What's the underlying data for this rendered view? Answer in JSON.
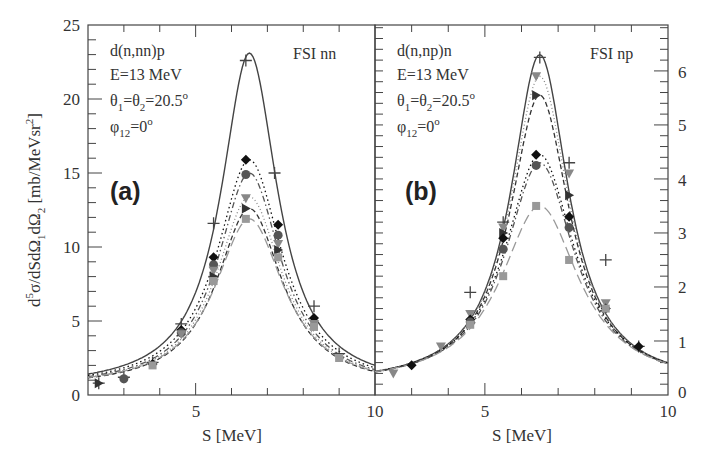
{
  "chart_data": [
    {
      "type": "line",
      "panel": "(a)",
      "title": "FSI nn",
      "annotations": [
        "d(n,nn)p",
        "E=13 MeV",
        "θ1=θ2=20.5°",
        "φ12=0°"
      ],
      "xlabel": "S [MeV]",
      "ylabel": "d5σ/dSdΩ1dΩ2 [mb/MeVsr2]",
      "xlim": [
        2,
        10
      ],
      "ylim": [
        0,
        25
      ],
      "x_ticks": [
        5,
        10
      ],
      "y_ticks": [
        0,
        5,
        10,
        15,
        20,
        25
      ],
      "peak_S": 6.5,
      "series": [
        {
          "name": "solid (+)",
          "style": "solid",
          "marker": "plus",
          "peak": 23.1,
          "width": 0.95,
          "tail": 0.9,
          "color": "#444444",
          "points": [
            [
              2.3,
              0.8
            ],
            [
              3.0,
              1.2
            ],
            [
              3.8,
              2.2
            ],
            [
              4.6,
              4.8
            ],
            [
              5.5,
              11.6
            ],
            [
              6.4,
              22.6
            ],
            [
              7.2,
              15.0
            ],
            [
              8.3,
              6.0
            ],
            [
              9.0,
              2.8
            ]
          ]
        },
        {
          "name": "dotted (◆)",
          "style": "dotted",
          "marker": "diamond",
          "peak": 15.9,
          "width": 1.1,
          "tail": 0.9,
          "color": "#111111",
          "points": [
            [
              3.8,
              2.1
            ],
            [
              4.6,
              4.4
            ],
            [
              5.5,
              9.3
            ],
            [
              6.4,
              15.9
            ],
            [
              7.3,
              11.5
            ],
            [
              8.3,
              5.2
            ]
          ]
        },
        {
          "name": "dash-dot (●)",
          "style": "dashdot",
          "marker": "circle",
          "peak": 15.0,
          "width": 1.08,
          "tail": 0.9,
          "color": "#555555",
          "points": [
            [
              3.0,
              1.1
            ],
            [
              4.6,
              4.2
            ],
            [
              5.5,
              8.8
            ],
            [
              6.4,
              14.9
            ],
            [
              7.3,
              10.8
            ]
          ]
        },
        {
          "name": "dotted (▼)",
          "style": "dotted2",
          "marker": "tri-down",
          "peak": 13.4,
          "width": 1.12,
          "tail": 0.9,
          "color": "#888888",
          "points": [
            [
              4.6,
              4.1
            ],
            [
              5.5,
              8.4
            ],
            [
              6.4,
              13.3
            ],
            [
              7.3,
              10.2
            ],
            [
              8.3,
              4.8
            ]
          ]
        },
        {
          "name": "dashed (▶)",
          "style": "dashed",
          "marker": "tri-right",
          "peak": 12.6,
          "width": 1.12,
          "tail": 0.9,
          "color": "#333333",
          "points": [
            [
              2.3,
              0.8
            ],
            [
              5.5,
              8.0
            ],
            [
              6.4,
              12.6
            ],
            [
              7.3,
              9.8
            ]
          ]
        },
        {
          "name": "long-dash (■)",
          "style": "longdash",
          "marker": "square",
          "peak": 11.9,
          "width": 1.18,
          "tail": 0.9,
          "color": "#999999",
          "points": [
            [
              3.8,
              2.0
            ],
            [
              5.5,
              7.7
            ],
            [
              6.4,
              11.9
            ],
            [
              7.3,
              9.3
            ],
            [
              8.3,
              4.6
            ],
            [
              9.0,
              2.5
            ]
          ]
        }
      ]
    },
    {
      "type": "line",
      "panel": "(b)",
      "title": "FSI np",
      "annotations": [
        "d(n,np)n",
        "E=13 MeV",
        "θ1=θ2=20.5°",
        "φ12=0°"
      ],
      "xlabel": "S [MeV]",
      "ylabel": "",
      "xlim": [
        2,
        10
      ],
      "ylim": [
        0,
        6.85
      ],
      "x_ticks": [
        5,
        10
      ],
      "y_ticks": [
        0,
        1,
        2,
        3,
        4,
        5,
        6
      ],
      "peak_S": 6.5,
      "series": [
        {
          "name": "solid (+)",
          "style": "solid",
          "marker": "plus",
          "peak": 6.3,
          "width": 0.95,
          "tail": 0.35,
          "color": "#444444",
          "points": [
            [
              4.6,
              1.9
            ],
            [
              5.5,
              3.2
            ],
            [
              6.5,
              6.25
            ],
            [
              7.3,
              4.3
            ],
            [
              8.3,
              2.5
            ],
            [
              9.2,
              0.9
            ]
          ]
        },
        {
          "name": "dotted (▼)",
          "style": "dotted2",
          "marker": "tri-down",
          "peak": 5.9,
          "width": 0.98,
          "tail": 0.35,
          "color": "#888888",
          "points": [
            [
              2.5,
              0.4
            ],
            [
              3.8,
              0.9
            ],
            [
              4.6,
              1.5
            ],
            [
              5.5,
              3.1
            ],
            [
              6.4,
              5.9
            ],
            [
              7.3,
              4.1
            ],
            [
              8.3,
              1.7
            ]
          ]
        },
        {
          "name": "dashed (▶)",
          "style": "dashed",
          "marker": "tri-right",
          "peak": 5.55,
          "width": 1.0,
          "tail": 0.35,
          "color": "#333333",
          "points": [
            [
              5.5,
              3.0
            ],
            [
              6.4,
              5.55
            ],
            [
              7.3,
              3.7
            ]
          ]
        },
        {
          "name": "dotted (◆)",
          "style": "dotted",
          "marker": "diamond",
          "peak": 4.45,
          "width": 1.15,
          "tail": 0.35,
          "color": "#111111",
          "points": [
            [
              3.0,
              0.55
            ],
            [
              4.6,
              1.4
            ],
            [
              5.5,
              2.9
            ],
            [
              6.4,
              4.45
            ],
            [
              7.3,
              3.3
            ],
            [
              8.3,
              1.6
            ],
            [
              9.2,
              0.9
            ]
          ]
        },
        {
          "name": "dash-dot (●)",
          "style": "dashdot",
          "marker": "circle",
          "peak": 4.3,
          "width": 1.15,
          "tail": 0.35,
          "color": "#555555",
          "points": [
            [
              4.6,
              1.35
            ],
            [
              5.5,
              2.7
            ],
            [
              6.4,
              4.25
            ],
            [
              7.3,
              3.1
            ]
          ]
        },
        {
          "name": "long-dash (■)",
          "style": "longdash",
          "marker": "square",
          "peak": 3.5,
          "width": 1.3,
          "tail": 0.35,
          "color": "#999999",
          "points": [
            [
              4.6,
              1.3
            ],
            [
              5.5,
              2.2
            ],
            [
              6.4,
              3.5
            ],
            [
              7.3,
              2.5
            ],
            [
              8.3,
              1.6
            ]
          ]
        }
      ]
    }
  ],
  "figure": {
    "panel_a": {
      "label": "(a)",
      "fsi": "FSI nn",
      "reaction": "d(n,nn)p",
      "energy": "E=13 MeV",
      "y_ticks": [
        "25",
        "20",
        "15",
        "10",
        "5",
        "0"
      ],
      "x_ticks": [
        "5",
        "10"
      ]
    },
    "panel_b": {
      "label": "(b)",
      "fsi": "FSI np",
      "reaction": "d(n,np)n",
      "energy": "E=13 MeV",
      "y_ticks": [
        "6",
        "5",
        "4",
        "3",
        "2",
        "1",
        "0"
      ],
      "x_ticks": [
        "5",
        "10"
      ]
    },
    "xlabel": "S [MeV]",
    "theta": {
      "a": "θ",
      "sub1": "1",
      "eq": "=θ",
      "sub2": "2",
      "val": "=20.5",
      "sup": "o"
    },
    "phi": {
      "a": "φ",
      "sub": "12",
      "val": "=0",
      "sup": "o"
    },
    "ylabel": {
      "d": "d",
      "five": "5",
      "body": "σ/dSdΩ",
      "s1": "1",
      "mid": "dΩ",
      "s2": "2",
      "unit": " [mb/MeVsr",
      "sq": "2",
      "close": "]"
    }
  }
}
